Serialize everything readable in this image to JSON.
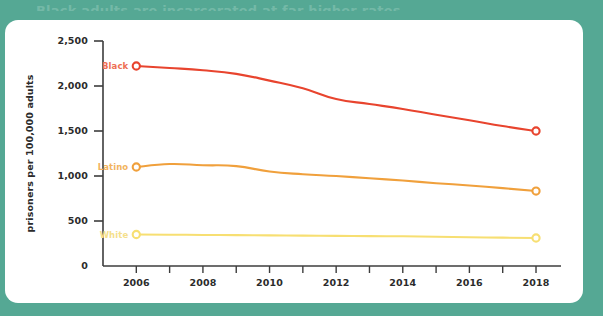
{
  "page": {
    "background_color": "#55a894",
    "card_color": "#ffffff",
    "clipped_title": "Black adults are incarcerated at far higher rates"
  },
  "chart_data": {
    "type": "line",
    "title": "",
    "xlabel": "",
    "ylabel": "prisoners per 100,000 adults",
    "x": [
      2006,
      2007,
      2008,
      2009,
      2010,
      2011,
      2012,
      2013,
      2014,
      2015,
      2016,
      2017,
      2018
    ],
    "xlim": [
      2005,
      2018.6
    ],
    "ylim": [
      0,
      2500
    ],
    "yticks": [
      0,
      500,
      1000,
      1500,
      2000,
      2500
    ],
    "ytick_labels": [
      "0",
      "500",
      "1,000",
      "1,500",
      "2,000",
      "2,500"
    ],
    "xticks": [
      2006,
      2007,
      2008,
      2009,
      2010,
      2011,
      2012,
      2013,
      2014,
      2015,
      2016,
      2017,
      2018
    ],
    "xtick_labels": [
      "2006",
      "",
      "2008",
      "",
      "2010",
      "",
      "2012",
      "",
      "2014",
      "",
      "2016",
      "",
      "2018"
    ],
    "grid": false,
    "legend_position": "inline-left",
    "series": [
      {
        "name": "Black",
        "color": "#e8442e",
        "label_color": "#ee6f53",
        "values": [
          2222,
          2200,
          2175,
          2135,
          2060,
          1975,
          1855,
          1800,
          1745,
          1680,
          1620,
          1555,
          1500
        ],
        "endpoint_markers": [
          2006,
          2018
        ]
      },
      {
        "name": "Latino",
        "color": "#f0a03c",
        "label_color": "#f2b45e",
        "values": [
          1100,
          1133,
          1120,
          1110,
          1050,
          1020,
          1000,
          975,
          950,
          920,
          895,
          865,
          833
        ],
        "endpoint_markers": [
          2006,
          2018
        ]
      },
      {
        "name": "White",
        "color": "#f7df72",
        "label_color": "#f5e08a",
        "values": [
          350,
          348,
          345,
          343,
          340,
          338,
          335,
          332,
          330,
          325,
          320,
          315,
          311
        ],
        "endpoint_markers": [
          2006,
          2018
        ]
      }
    ]
  }
}
